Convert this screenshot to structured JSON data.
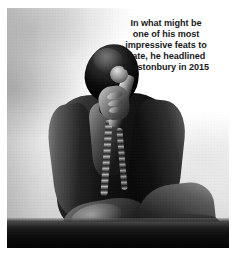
{
  "image": {
    "kind": "photograph",
    "treatment": "black-and-white",
    "subject": "male performer kneeling on stage holding a microphone, wearing a dark leather jacket with chain necklaces, backlit by stage smoke",
    "scene": {
      "background": "bright smoky stage haze",
      "floor_band": "dark stage edge along the bottom"
    },
    "frame": {
      "border_color": "#ffffff",
      "photo_left": 7,
      "photo_top": 8,
      "photo_width": 222,
      "photo_height": 240
    }
  },
  "caption": {
    "text": "In what might be\none of his most\nimpressive feats to\ndate, he headlined\nGlastonbury in 2015",
    "lines": [
      "In what might be",
      "one of his most",
      "impressive feats to",
      "date, he headlined",
      "Glastonbury in 2015"
    ],
    "align": "center",
    "weight": "bold",
    "color": "#18181a",
    "year_mentioned": "2015",
    "festival_mentioned": "Glastonbury"
  },
  "colors": {
    "page_background": "#ffffff",
    "text": "#18181a",
    "haze_light": "#ffffff",
    "haze_mid": "#cfcfcf",
    "stage_dark": "#0c0c0c"
  }
}
